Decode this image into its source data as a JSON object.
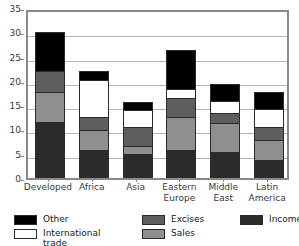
{
  "chart_data": {
    "type": "bar",
    "subtype": "stacked-vertical",
    "title": "",
    "xlabel": "",
    "ylabel": "",
    "ylim": [
      0,
      35
    ],
    "y_ticks": [
      0,
      5,
      10,
      15,
      20,
      25,
      30,
      35
    ],
    "grid": true,
    "legend_position": "bottom",
    "categories": [
      "Developed",
      "Africa",
      "Asia",
      "Eastern Europe",
      "Middle East",
      "Latin America"
    ],
    "category_lines": [
      [
        "Developed"
      ],
      [
        "Africa"
      ],
      [
        "Asia"
      ],
      [
        "Eastern",
        "Europe"
      ],
      [
        "Middle",
        "East"
      ],
      [
        "Latin",
        "America"
      ]
    ],
    "series": [
      {
        "name": "Income",
        "color": "#2b2b2b",
        "values": [
          11.5,
          5.8,
          5.0,
          5.7,
          5.4,
          3.7
        ]
      },
      {
        "name": "Sales",
        "color": "#8f8f8f",
        "values": [
          6.3,
          4.0,
          1.5,
          6.9,
          5.9,
          4.1
        ]
      },
      {
        "name": "Excises",
        "color": "#5e5e5e",
        "values": [
          4.2,
          2.8,
          4.0,
          3.8,
          2.0,
          2.6
        ]
      },
      {
        "name": "International trade",
        "color": "#ffffff",
        "values": [
          0.0,
          7.5,
          3.5,
          2.0,
          2.6,
          3.8
        ]
      },
      {
        "name": "Other",
        "color": "#000000",
        "values": [
          8.0,
          1.9,
          1.7,
          8.0,
          3.5,
          3.5
        ]
      }
    ],
    "totals": [
      30.0,
      22.0,
      15.7,
      26.4,
      19.4,
      17.7
    ]
  },
  "legend": {
    "columns": [
      {
        "entries": [
          {
            "label": "Other",
            "swatch": "#000000"
          },
          {
            "label": "International\ntrade",
            "swatch": "#ffffff"
          }
        ]
      },
      {
        "entries": [
          {
            "label": "Excises",
            "swatch": "#5e5e5e"
          },
          {
            "label": "Sales",
            "swatch": "#8f8f8f"
          }
        ]
      },
      {
        "entries": [
          {
            "label": "Income",
            "swatch": "#2b2b2b"
          }
        ]
      }
    ]
  }
}
